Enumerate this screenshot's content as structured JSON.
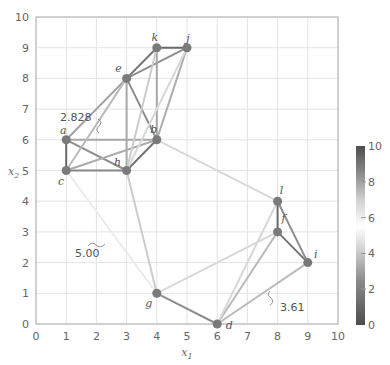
{
  "chart_data": {
    "type": "graph-scatter",
    "title": "",
    "xlabel": "x1",
    "ylabel": "x2",
    "xlim": [
      0,
      10
    ],
    "ylim": [
      0,
      10
    ],
    "grid": true,
    "x_ticks": [
      "0",
      "1",
      "2",
      "3",
      "4",
      "5",
      "6",
      "7",
      "8",
      "9",
      "10"
    ],
    "y_ticks": [
      "0",
      "1",
      "2",
      "3",
      "4",
      "5",
      "6",
      "7",
      "8",
      "9",
      "10"
    ],
    "nodes": [
      {
        "id": "a",
        "x": 1,
        "y": 6
      },
      {
        "id": "b",
        "x": 4,
        "y": 6
      },
      {
        "id": "c",
        "x": 1,
        "y": 5
      },
      {
        "id": "d",
        "x": 6,
        "y": 0
      },
      {
        "id": "e",
        "x": 3,
        "y": 8
      },
      {
        "id": "f",
        "x": 8,
        "y": 3
      },
      {
        "id": "g",
        "x": 4,
        "y": 1
      },
      {
        "id": "h",
        "x": 3,
        "y": 5
      },
      {
        "id": "i",
        "x": 9,
        "y": 2
      },
      {
        "id": "j",
        "x": 5,
        "y": 9
      },
      {
        "id": "k",
        "x": 4,
        "y": 9
      },
      {
        "id": "l",
        "x": 8,
        "y": 4
      }
    ],
    "edges": [
      {
        "from": "a",
        "to": "c",
        "weight": 1.0
      },
      {
        "from": "a",
        "to": "b",
        "weight": 3.0
      },
      {
        "from": "a",
        "to": "h",
        "weight": 2.236
      },
      {
        "from": "a",
        "to": "e",
        "weight": 2.828
      },
      {
        "from": "c",
        "to": "h",
        "weight": 2.0
      },
      {
        "from": "c",
        "to": "b",
        "weight": 3.162
      },
      {
        "from": "c",
        "to": "e",
        "weight": 3.606
      },
      {
        "from": "c",
        "to": "g",
        "weight": 5.0
      },
      {
        "from": "h",
        "to": "b",
        "weight": 1.414
      },
      {
        "from": "h",
        "to": "e",
        "weight": 3.0
      },
      {
        "from": "h",
        "to": "g",
        "weight": 4.123
      },
      {
        "from": "h",
        "to": "k",
        "weight": 4.123
      },
      {
        "from": "h",
        "to": "j",
        "weight": 4.472
      },
      {
        "from": "e",
        "to": "b",
        "weight": 2.236
      },
      {
        "from": "e",
        "to": "k",
        "weight": 1.414
      },
      {
        "from": "e",
        "to": "j",
        "weight": 2.236
      },
      {
        "from": "k",
        "to": "j",
        "weight": 1.0
      },
      {
        "from": "k",
        "to": "b",
        "weight": 3.0
      },
      {
        "from": "j",
        "to": "b",
        "weight": 3.162
      },
      {
        "from": "b",
        "to": "l",
        "weight": 4.472
      },
      {
        "from": "g",
        "to": "d",
        "weight": 2.236
      },
      {
        "from": "g",
        "to": "f",
        "weight": 4.472
      },
      {
        "from": "d",
        "to": "f",
        "weight": 3.606
      },
      {
        "from": "d",
        "to": "l",
        "weight": 4.472
      },
      {
        "from": "d",
        "to": "i",
        "weight": 3.606
      },
      {
        "from": "l",
        "to": "f",
        "weight": 1.0
      },
      {
        "from": "f",
        "to": "i",
        "weight": 1.414
      },
      {
        "from": "l",
        "to": "i",
        "weight": 2.236
      }
    ],
    "annotations": [
      {
        "text": "2.828",
        "edge": "a-e"
      },
      {
        "text": "5.00",
        "edge": "c-g"
      },
      {
        "text": "3.61",
        "edge": "d-i"
      }
    ],
    "colorbar": {
      "min": 0,
      "max": 10,
      "ticks": [
        "0",
        "2",
        "4",
        "6",
        "8",
        "10"
      ],
      "colormap": "gray diverging (dark at 0 and 10, white near 5.5)"
    }
  },
  "colors": {
    "node": "#7a7a7a",
    "grid": "#e4e4e4",
    "axis": "#b0b0b0",
    "dark_end": "#4d4d4d"
  }
}
